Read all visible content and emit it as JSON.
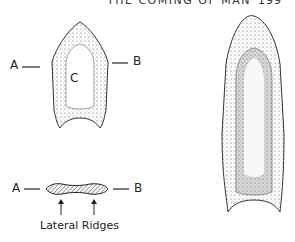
{
  "page": {
    "running_head": "THE COMING OF MAN",
    "page_number": "199"
  },
  "figure_left": {
    "point_labels": {
      "left": "A",
      "right": "B",
      "center": "C"
    },
    "cross_section": {
      "left": "A",
      "right": "B",
      "caption": "Lateral Ridges"
    }
  },
  "figure_right": {
    "description": "fluted projectile point drawing"
  }
}
